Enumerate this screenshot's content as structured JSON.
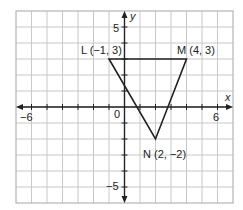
{
  "chart_data": {
    "type": "scatter",
    "title": "",
    "xlabel": "x",
    "ylabel": "y",
    "xlim": [
      -7,
      7
    ],
    "ylim": [
      -6,
      6
    ],
    "grid": true,
    "x_tick_labels": [
      {
        "value": -6,
        "label": "−6"
      },
      {
        "value": 0,
        "label": "0"
      },
      {
        "value": 6,
        "label": "6"
      }
    ],
    "y_tick_labels": [
      {
        "value": 5,
        "label": "5"
      },
      {
        "value": -5,
        "label": "−5"
      }
    ],
    "shape": {
      "kind": "triangle",
      "name": "LMN",
      "vertices": [
        {
          "name": "L",
          "x": -1,
          "y": 3,
          "label": "L (−1, 3)"
        },
        {
          "name": "M",
          "x": 4,
          "y": 3,
          "label": "M (4, 3)"
        },
        {
          "name": "N",
          "x": 2,
          "y": -2,
          "label": "N (2, −2)"
        }
      ]
    }
  },
  "colors": {
    "background": "#ffffff",
    "grid": "#c8c8c8",
    "border": "#b4b4b4",
    "axis": "#222222",
    "shape": "#222222"
  }
}
